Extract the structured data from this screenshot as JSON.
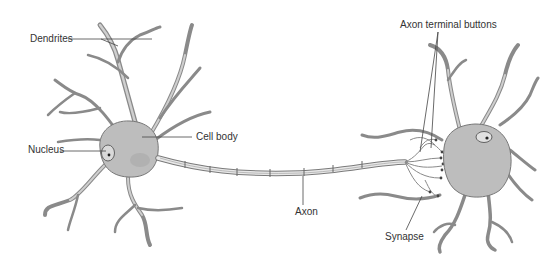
{
  "diagram": {
    "labels": {
      "dendrites": "Dendrites",
      "nucleus": "Nucleus",
      "cell_body": "Cell body",
      "axon": "Axon",
      "axon_terminal_buttons": "Axon terminal buttons",
      "synapse": "Synapse"
    },
    "colors": {
      "cell_fill": "#bdbdbd",
      "outline": "#777777",
      "label_text": "#333333",
      "background": "#ffffff"
    }
  }
}
